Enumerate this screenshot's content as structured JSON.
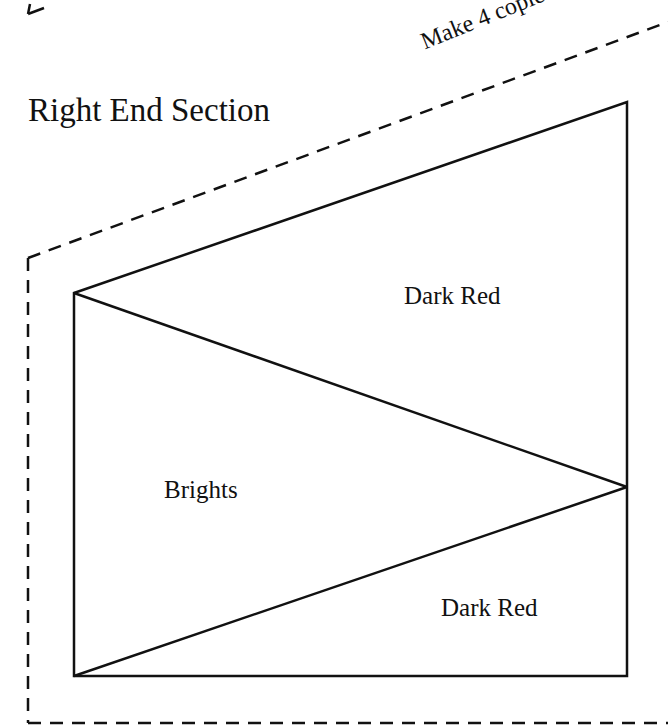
{
  "title": "Right End Section",
  "instruction": "Make 4 copies",
  "regions": [
    {
      "id": "top-triangle",
      "label": "Dark Red"
    },
    {
      "id": "middle-triangle",
      "label": "Brights"
    },
    {
      "id": "bottom-triangle",
      "label": "Dark Red"
    }
  ],
  "colors": {
    "stroke": "#111111",
    "background": "#ffffff"
  }
}
